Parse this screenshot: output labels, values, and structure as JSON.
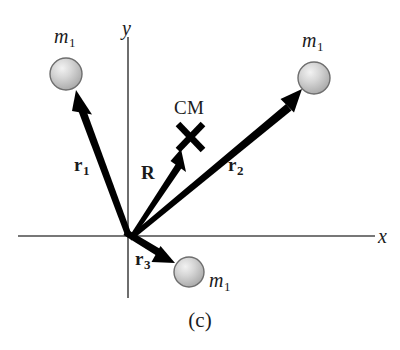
{
  "figure": {
    "caption": "(c)",
    "axes": {
      "x_label": "x",
      "y_label": "y",
      "x_axis_color": "#4a4a4a",
      "y_axis_color": "#4a4a4a"
    },
    "center_of_mass": {
      "label": "CM",
      "marker": "x-cross-marker"
    },
    "masses": [
      {
        "id": "mass-upper-left",
        "label": "m",
        "subscript": "1",
        "cx": 66,
        "cy": 74,
        "r": 16
      },
      {
        "id": "mass-upper-right",
        "label": "m",
        "subscript": "1",
        "cx": 314,
        "cy": 78,
        "r": 16
      },
      {
        "id": "mass-lower",
        "label": "m",
        "subscript": "1",
        "cx": 189,
        "cy": 272,
        "r": 15
      }
    ],
    "vectors": [
      {
        "id": "vector-r1",
        "label": "r",
        "subscript": "1",
        "from": [
          128,
          232
        ],
        "to": [
          76,
          90
        ]
      },
      {
        "id": "vector-R",
        "label": "R",
        "subscript": "",
        "from": [
          128,
          232
        ],
        "to": [
          180,
          150
        ]
      },
      {
        "id": "vector-r2",
        "label": "r",
        "subscript": "2",
        "from": [
          128,
          232
        ],
        "to": [
          302,
          89
        ]
      },
      {
        "id": "vector-r3",
        "label": "r",
        "subscript": "3",
        "from": [
          128,
          232
        ],
        "to": [
          175,
          263
        ]
      }
    ],
    "colors": {
      "vector": "#000000",
      "axis": "#4a4a4a",
      "sphere_fill": "#c9c9c9",
      "sphere_highlight": "#ededed",
      "sphere_stroke": "#6e6e6e",
      "text": "#1b1b1b",
      "background": "#ffffff"
    }
  }
}
